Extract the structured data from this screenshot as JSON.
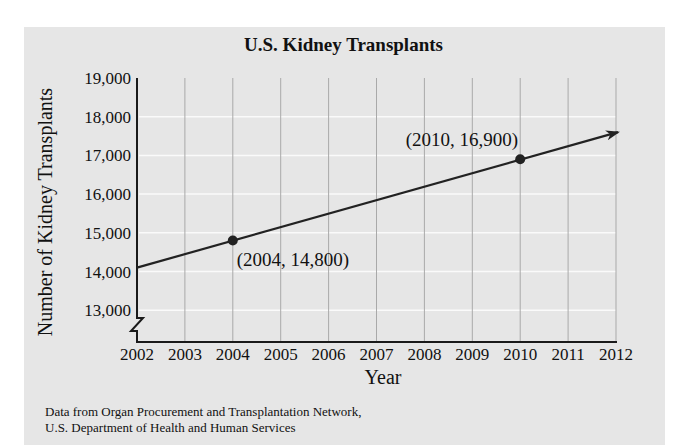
{
  "chart_data": {
    "type": "line",
    "title": "U.S. Kidney Transplants",
    "xlabel": "Year",
    "ylabel": "Number of Kidney Transplants",
    "x_ticks": [
      "2002",
      "2003",
      "2004",
      "2005",
      "2006",
      "2007",
      "2008",
      "2009",
      "2010",
      "2011",
      "2012"
    ],
    "y_ticks": [
      "13,000",
      "14,000",
      "15,000",
      "16,000",
      "17,000",
      "18,000",
      "19,000"
    ],
    "xlim": [
      2002,
      2012
    ],
    "ylim": [
      12500,
      19000
    ],
    "y_axis_break": true,
    "grid": true,
    "series": [
      {
        "name": "Linear model",
        "x": [
          2002,
          2004,
          2010,
          2012
        ],
        "y": [
          14100,
          14800,
          16900,
          17600
        ],
        "arrow_end": true
      }
    ],
    "points": [
      {
        "x": 2004,
        "y": 14800,
        "label": "(2004, 14,800)"
      },
      {
        "x": 2010,
        "y": 16900,
        "label": "(2010, 16,900)"
      }
    ],
    "source": [
      "Data from Organ Procurement and Transplantation Network,",
      "U.S. Department of Health and Human Services"
    ]
  }
}
